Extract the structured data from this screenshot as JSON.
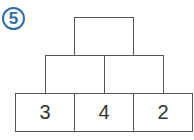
{
  "exercise": {
    "number": "5",
    "accent_color": "#2f6ea6"
  },
  "pyramid": {
    "top": [
      ""
    ],
    "middle": [
      "",
      ""
    ],
    "bottom": [
      "3",
      "4",
      "2"
    ]
  }
}
